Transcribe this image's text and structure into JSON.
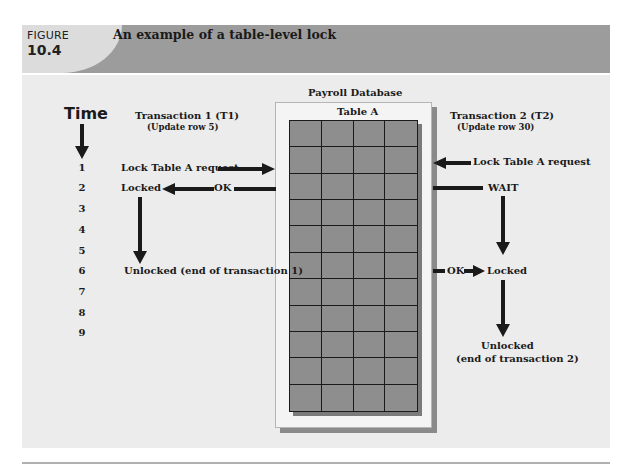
{
  "figure": {
    "label": "FIGURE",
    "number": "10.4",
    "title": "An example of a table-level lock"
  },
  "diagram": {
    "time_label": "Time",
    "time_steps": [
      "1",
      "2",
      "3",
      "4",
      "5",
      "6",
      "7",
      "8",
      "9"
    ],
    "database": {
      "name": "Payroll Database",
      "table_name": "Table A",
      "grid_columns": 4,
      "grid_rows": 11
    },
    "transaction1": {
      "title": "Transaction 1 (T1)",
      "subtitle": "(Update row 5)",
      "events": {
        "request": "Lock Table A request",
        "ok": "OK",
        "locked": "Locked",
        "unlocked": "Unlocked (end of transaction 1)"
      }
    },
    "transaction2": {
      "title": "Transaction 2 (T2)",
      "subtitle": "(Update row 30)",
      "events": {
        "request": "Lock Table A request",
        "wait": "WAIT",
        "ok": "OK",
        "locked": "Locked",
        "unlocked_line1": "Unlocked",
        "unlocked_line2": "(end of transaction 2)"
      }
    },
    "colors": {
      "header_dark": "#9c9c9c",
      "header_light": "#dcdcdc",
      "panel": "#ececec",
      "grid_fill": "#8e8e8e",
      "ink": "#1a1a1a"
    }
  }
}
